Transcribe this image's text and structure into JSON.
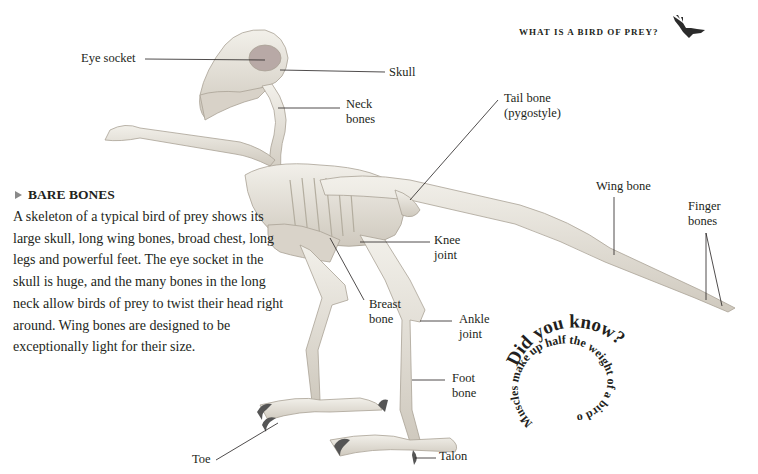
{
  "header": {
    "section_title": "WHAT IS A BIRD OF PREY?",
    "icon": "eagle-silhouette-icon"
  },
  "sidebar": {
    "marker_icon": "triangle-right-icon",
    "title": "BARE BONES",
    "body": "A skeleton of a typical bird of prey shows its large skull, long wing bones, broad chest, long legs and powerful feet. The eye socket in the skull is huge, and the many bones in the long neck allow birds of prey to twist their head right around. Wing bones are designed to be exceptionally light for their size."
  },
  "labels": {
    "eye_socket": "Eye socket",
    "skull": "Skull",
    "neck_bones_1": "Neck",
    "neck_bones_2": "bones",
    "tail_bone_1": "Tail bone",
    "tail_bone_2": "(pygostyle)",
    "wing_bone": "Wing bone",
    "finger_bones_1": "Finger",
    "finger_bones_2": "bones",
    "knee_joint_1": "Knee",
    "knee_joint_2": "joint",
    "breast_bone_1": "Breast",
    "breast_bone_2": "bone",
    "ankle_joint_1": "Ankle",
    "ankle_joint_2": "joint",
    "foot_bone_1": "Foot",
    "foot_bone_2": "bone",
    "toe": "Toe",
    "talon": "Talon"
  },
  "did_you_know": {
    "heading": "Did you know?",
    "fact": "Muscles make up half the weight of a bird of prey."
  },
  "colors": {
    "text": "#231f20",
    "bone": "#e9e6df",
    "bone_shadow": "#bdb7ac",
    "marker": "#8a8a8a"
  }
}
